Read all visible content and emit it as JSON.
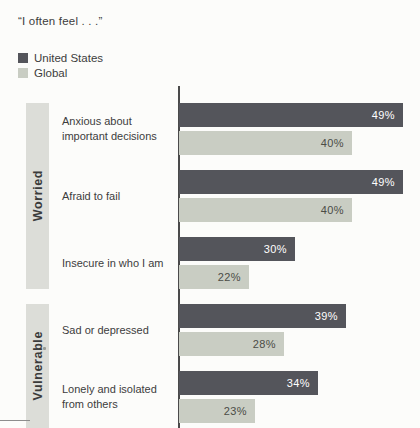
{
  "title": "“I often feel . . .”",
  "legend": [
    {
      "label": "United States",
      "color": "#54555b"
    },
    {
      "label": "Global",
      "color": "#c9cdc3"
    }
  ],
  "chart_data": {
    "type": "bar",
    "orientation": "horizontal",
    "title": "“I often feel . . .”",
    "value_suffix": "%",
    "xlim": [
      0,
      52
    ],
    "grid": false,
    "legend_position": "top-left",
    "categories": [
      "Anxious about important decisions",
      "Afraid to fail",
      "Insecure in who I am",
      "Sad or depressed",
      "Lonely and isolated from others"
    ],
    "series": [
      {
        "name": "United States",
        "values": [
          49,
          49,
          30,
          39,
          34
        ],
        "color": "#54555b",
        "label_color": "#ffffff"
      },
      {
        "name": "Global",
        "values": [
          40,
          40,
          22,
          28,
          23
        ],
        "color": "#c9cdc3",
        "label_color": "#4b4c46"
      }
    ],
    "groups": [
      {
        "label": "Worried",
        "categories": [
          "Anxious about important decisions",
          "Afraid to fail",
          "Insecure in who I am"
        ]
      },
      {
        "label": "Vulnerable",
        "categories": [
          "Sad or depressed",
          "Lonely and isolated from others"
        ]
      }
    ]
  }
}
